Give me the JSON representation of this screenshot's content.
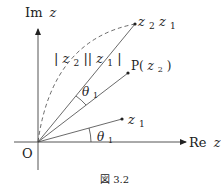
{
  "diagram": {
    "axes": {
      "im_label": "Im",
      "im_var": "z",
      "re_label": "Re",
      "re_var": "z",
      "origin_label": "O"
    },
    "points": {
      "z1": {
        "label": "z",
        "sub": "1"
      },
      "p": {
        "label": "P(",
        "var": "z",
        "sub": "2",
        "close": ")"
      },
      "z2z1": {
        "label1": "z",
        "sub1": "2",
        "label2": "z",
        "sub2": "1"
      }
    },
    "annotations": {
      "modulus": {
        "bar1": "|",
        "var1": "z",
        "sub1": "2",
        "bar2": "||",
        "var2": "z",
        "sub2": "1",
        "bar3": "|"
      },
      "theta_top": {
        "label": "θ",
        "sub": "1"
      },
      "theta_bottom": {
        "label": "θ",
        "sub": "1"
      }
    },
    "caption": "図 3.2"
  }
}
